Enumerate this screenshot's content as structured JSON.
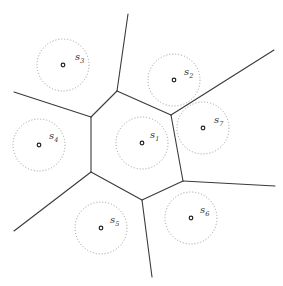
{
  "diagram": {
    "type": "voronoi",
    "width": 283,
    "height": 286,
    "colors": {
      "edge": "#3a3a3a",
      "ring": "#9a9a9a",
      "site": "#222222",
      "label": "#333333",
      "background": "#ffffff"
    },
    "circle_radius": 26,
    "vertices": [
      {
        "id": "A",
        "x": 117,
        "y": 91
      },
      {
        "id": "B",
        "x": 171,
        "y": 115
      },
      {
        "id": "C",
        "x": 183,
        "y": 181
      },
      {
        "id": "D",
        "x": 142,
        "y": 200
      },
      {
        "id": "E",
        "x": 91,
        "y": 172
      },
      {
        "id": "F",
        "x": 91,
        "y": 117
      }
    ],
    "rays": [
      {
        "from": "A",
        "x2": 128,
        "y2": 14
      },
      {
        "from": "B",
        "x2": 274,
        "y2": 50
      },
      {
        "from": "C",
        "x2": 275,
        "y2": 186
      },
      {
        "from": "D",
        "x2": 152,
        "y2": 277
      },
      {
        "from": "E",
        "x2": 14,
        "y2": 231
      },
      {
        "from": "F",
        "x2": 14,
        "y2": 92
      }
    ],
    "sites": [
      {
        "name": "s",
        "sub": "1",
        "x": 142,
        "y": 143,
        "lx": 150,
        "ly": 138
      },
      {
        "name": "s",
        "sub": "2",
        "x": 174,
        "y": 80,
        "lx": 184,
        "ly": 75
      },
      {
        "name": "s",
        "sub": "3",
        "x": 63,
        "y": 65,
        "lx": 75,
        "ly": 60
      },
      {
        "name": "s",
        "sub": "4",
        "x": 39,
        "y": 145,
        "lx": 49,
        "ly": 139
      },
      {
        "name": "s",
        "sub": "5",
        "x": 101,
        "y": 228,
        "lx": 110,
        "ly": 223
      },
      {
        "name": "s",
        "sub": "6",
        "x": 191,
        "y": 218,
        "lx": 200,
        "ly": 213
      },
      {
        "name": "s",
        "sub": "7",
        "x": 203,
        "y": 128,
        "lx": 214,
        "ly": 123
      }
    ]
  }
}
